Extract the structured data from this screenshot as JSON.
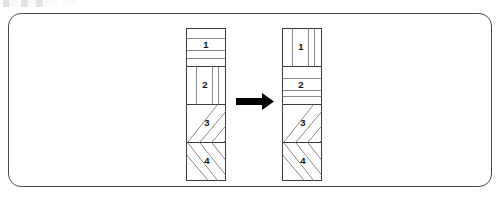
{
  "top_text_fragment": "█░ █░█░░ ░░",
  "panel": {
    "border_color": "#4a4a4a",
    "background_color": "#ffffff",
    "corner_radius": "13px"
  },
  "colors": {
    "outline": "#3c3c3c",
    "hatch": "#7d7d7d",
    "arrow": "#000000",
    "label": "#111111",
    "fill": "#ffffff"
  },
  "arrow": {
    "name": "right-arrow-icon",
    "direction": "right",
    "color": "#000000",
    "meaning": "transforms into"
  },
  "diagram": {
    "type": "before-after-transformation",
    "bars": [
      {
        "id": "before",
        "role": "before",
        "position": "left",
        "sections": [
          {
            "label": "1",
            "hatch": "horizontal"
          },
          {
            "label": "2",
            "hatch": "vertical"
          },
          {
            "label": "3",
            "hatch": "diagonal-up-right"
          },
          {
            "label": "4",
            "hatch": "diagonal-down-right"
          }
        ]
      },
      {
        "id": "after",
        "role": "after",
        "position": "right",
        "sections": [
          {
            "label": "1",
            "hatch": "vertical"
          },
          {
            "label": "2",
            "hatch": "horizontal"
          },
          {
            "label": "3",
            "hatch": "diagonal-up-right"
          },
          {
            "label": "4",
            "hatch": "diagonal-down-right"
          }
        ]
      }
    ]
  }
}
